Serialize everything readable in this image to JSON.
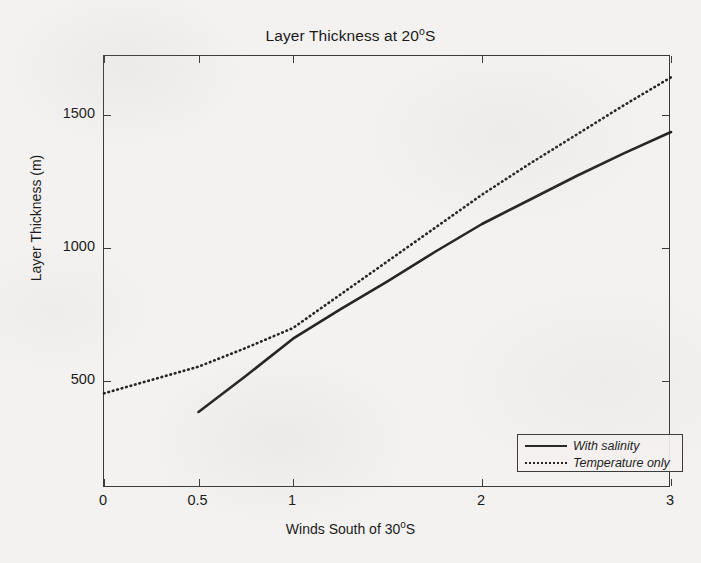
{
  "figure": {
    "title_prefix": "Layer Thickness at 20",
    "title_sup": "o",
    "title_suffix": "S",
    "title_full": "Layer Thickness at 20oS",
    "background_color": "#f4f2f1",
    "axis_color": "#3a3a3a",
    "line_color": "#252525"
  },
  "axes": {
    "xlabel_prefix": "Winds South of 30",
    "xlabel_sup": "o",
    "xlabel_suffix": "S",
    "xlabel_full": "Winds South of 30oS",
    "ylabel": "Layer Thickness (m)",
    "xticklabels": [
      "0",
      "0.5",
      "1",
      "2",
      "3"
    ],
    "xtickvalues": [
      0,
      0.5,
      1,
      2,
      3
    ],
    "yticklabels": [
      "500",
      "1000",
      "1500"
    ],
    "ytickvalues": [
      500,
      1000,
      1500
    ],
    "xlim": [
      0,
      3
    ],
    "ylim": [
      100,
      1720
    ],
    "grid": "off",
    "box": "on"
  },
  "legend": {
    "position": "inside-lower-right",
    "entries": [
      {
        "label": "With salinity",
        "style": "solid"
      },
      {
        "label": "Temperature only",
        "style": "dotted"
      }
    ]
  },
  "chart_data": {
    "type": "line",
    "title": "Layer Thickness at 20oS",
    "xlabel": "Winds South of 30oS",
    "ylabel": "Layer Thickness (m)",
    "xlim": [
      0,
      3
    ],
    "ylim": [
      100,
      1720
    ],
    "grid": false,
    "legend_position": "inside lower-right",
    "series": [
      {
        "name": "With salinity",
        "style": "solid",
        "x": [
          0.5,
          0.75,
          1.0,
          1.25,
          1.5,
          1.75,
          2.0,
          2.25,
          2.5,
          2.75,
          3.0
        ],
        "y": [
          385,
          520,
          660,
          770,
          875,
          985,
          1090,
          1180,
          1270,
          1355,
          1435
        ]
      },
      {
        "name": "Temperature only",
        "style": "dotted",
        "x": [
          0.0,
          0.25,
          0.5,
          0.75,
          1.0,
          1.25,
          1.5,
          1.75,
          2.0,
          2.25,
          2.5,
          2.75,
          3.0
        ],
        "y": [
          455,
          505,
          555,
          625,
          700,
          825,
          950,
          1075,
          1200,
          1315,
          1425,
          1535,
          1640
        ]
      }
    ]
  }
}
